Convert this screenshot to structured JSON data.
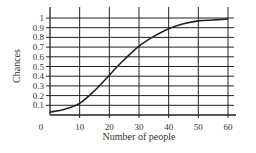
{
  "chart_data": {
    "type": "line",
    "title": "",
    "xlabel": "Number of people",
    "ylabel": "Chances",
    "xlim": [
      0,
      60
    ],
    "ylim": [
      0,
      1
    ],
    "x_ticks": [
      "0",
      "10",
      "20",
      "30",
      "40",
      "50",
      "60"
    ],
    "y_ticks": [
      "0.1",
      "0.2",
      "0.3",
      "0.4",
      "0.5",
      "0.6",
      "0.7",
      "0.8",
      "0.9",
      "1"
    ],
    "grid": true,
    "legend": null,
    "series": [
      {
        "name": "Chances",
        "x": [
          0,
          5,
          10,
          15,
          20,
          23,
          25,
          30,
          35,
          40,
          45,
          50,
          55,
          60
        ],
        "values": [
          0.03,
          0.06,
          0.12,
          0.25,
          0.41,
          0.51,
          0.57,
          0.71,
          0.81,
          0.89,
          0.94,
          0.97,
          0.98,
          0.99
        ]
      }
    ],
    "colors": {
      "line": "#222222",
      "grid": "#222222",
      "background": "#ffffff"
    }
  }
}
